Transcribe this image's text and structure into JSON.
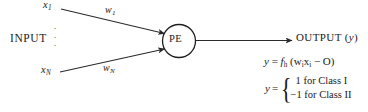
{
  "diagram": {
    "input_label": "INPUT",
    "vertical_dots": "·\n·\n·",
    "inputs": [
      {
        "name": "x",
        "subscript": "1"
      },
      {
        "name": "x",
        "subscript": "N"
      }
    ],
    "weights": [
      {
        "name": "w",
        "subscript": "1"
      },
      {
        "name": "w",
        "subscript": "N"
      }
    ],
    "node_label": "PE",
    "output_label": "OUTPUT (",
    "output_var": "y",
    "output_label_close": ")",
    "equation": {
      "lhs": "y",
      "eq": " = ",
      "fn": "f",
      "fn_sub": "h",
      "open": " (w",
      "sub_i_1": "i",
      "x": "x",
      "sub_i_2": "i",
      "minus": " − O)"
    },
    "cases": {
      "lhs": "y",
      "eq": "=",
      "brace": "{",
      "rows": [
        "1 for Class I",
        "−1 for Class II"
      ]
    },
    "colors": {
      "background": "#ffffff",
      "ink": "#1a1a1a",
      "stroke": "#2a2a2a"
    }
  }
}
